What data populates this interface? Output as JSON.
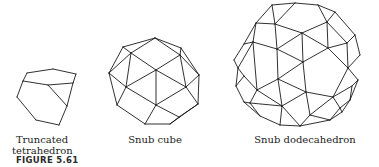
{
  "figure": {
    "label": "FIGURE 5.61",
    "items": [
      {
        "id": "truncated-tetrahedron",
        "caption_line1": "Truncated",
        "caption_line2": "tetrahedron"
      },
      {
        "id": "snub-cube",
        "caption_line1": "Snub cube"
      },
      {
        "id": "snub-dodecahedron",
        "caption_line1": "Snub dodecahedron"
      }
    ],
    "line_color": "#1a1a1a"
  }
}
